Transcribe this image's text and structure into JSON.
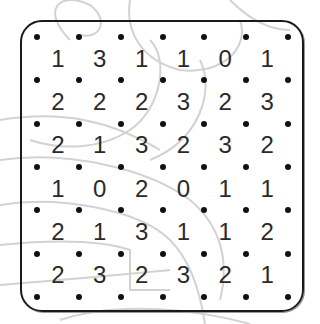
{
  "puzzle": {
    "type": "slitherlink",
    "rows": 6,
    "cols": 6,
    "clues": [
      [
        "1",
        "3",
        "1",
        "1",
        "0",
        "1"
      ],
      [
        "2",
        "2",
        "2",
        "3",
        "2",
        "3"
      ],
      [
        "2",
        "1",
        "3",
        "2",
        "3",
        "2"
      ],
      [
        "1",
        "0",
        "2",
        "0",
        "1",
        "1"
      ],
      [
        "2",
        "1",
        "3",
        "1",
        "1",
        "2"
      ],
      [
        "2",
        "3",
        "2",
        "3",
        "2",
        "1"
      ]
    ]
  },
  "colors": {
    "dot": "#111111",
    "frame": "#1a1a1a",
    "clue": "#2a2a2a",
    "sketch": "#d0d0d0"
  }
}
